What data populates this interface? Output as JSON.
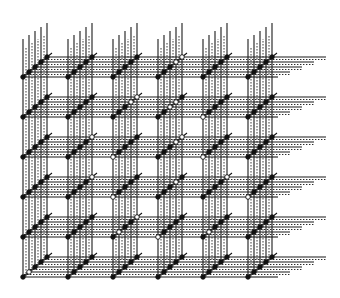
{
  "diagram": {
    "title": "",
    "type": "3D lattice grid (6x6 cells, 5 diagonal nodes per cell)",
    "grid": {
      "rows": 6,
      "cols": 6,
      "origin_x": 23,
      "origin_y": 77,
      "col_spacing": 45,
      "row_spacing": 40,
      "diag_step_x": 6,
      "diag_step_y": -5,
      "nodes_per_cell": 5,
      "top_y": 25,
      "right_extent": 300
    },
    "colors": {
      "line": "#1a1a1a",
      "node_fill": "#111111",
      "open_fill": "#ffffff",
      "background": "#ffffff"
    },
    "open_nodes": [
      {
        "row": 0,
        "col": 3,
        "node": 3
      },
      {
        "row": 0,
        "col": 3,
        "node": 4
      },
      {
        "row": 1,
        "col": 2,
        "node": 3
      },
      {
        "row": 1,
        "col": 2,
        "node": 4
      },
      {
        "row": 1,
        "col": 3,
        "node": 2
      },
      {
        "row": 1,
        "col": 3,
        "node": 3
      },
      {
        "row": 1,
        "col": 4,
        "node": 0
      },
      {
        "row": 2,
        "col": 1,
        "node": 4
      },
      {
        "row": 2,
        "col": 2,
        "node": 0
      },
      {
        "row": 2,
        "col": 3,
        "node": 3
      },
      {
        "row": 2,
        "col": 3,
        "node": 4
      },
      {
        "row": 2,
        "col": 4,
        "node": 0
      },
      {
        "row": 3,
        "col": 1,
        "node": 4
      },
      {
        "row": 3,
        "col": 2,
        "node": 0
      },
      {
        "row": 3,
        "col": 3,
        "node": 3
      },
      {
        "row": 3,
        "col": 5,
        "node": 0
      },
      {
        "row": 3,
        "col": 4,
        "node": 4
      },
      {
        "row": 4,
        "col": 2,
        "node": 1
      },
      {
        "row": 4,
        "col": 2,
        "node": 4
      },
      {
        "row": 4,
        "col": 3,
        "node": 0
      },
      {
        "row": 4,
        "col": 4,
        "node": 1
      },
      {
        "row": 5,
        "col": 0,
        "node": 1
      }
    ]
  }
}
